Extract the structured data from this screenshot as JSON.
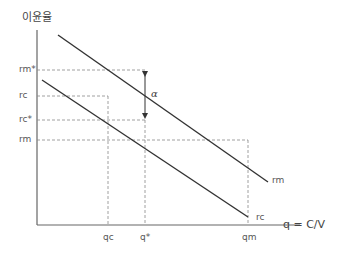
{
  "diagram": {
    "y_axis_label": "이윤율",
    "x_axis_label": "q = C/V",
    "y_ticks": [
      {
        "label": "rm*",
        "y": 70
      },
      {
        "label": "rc",
        "y": 96
      },
      {
        "label": "rc*",
        "y": 120
      },
      {
        "label": "rm",
        "y": 140
      }
    ],
    "x_ticks": [
      {
        "label": "qc",
        "x": 108
      },
      {
        "label": "q*",
        "x": 145
      },
      {
        "label": "qm",
        "x": 248
      }
    ],
    "lines": [
      {
        "name": "rm",
        "label": "rm",
        "from": [
          58,
          35
        ],
        "to": [
          268,
          182
        ]
      },
      {
        "name": "rc",
        "label": "rc",
        "from": [
          42,
          80
        ],
        "to": [
          248,
          217
        ]
      }
    ],
    "gap_label": "α",
    "colors": {
      "line": "#333333",
      "axis": "#666666",
      "dashed": "#888888",
      "text": "#555555"
    }
  }
}
